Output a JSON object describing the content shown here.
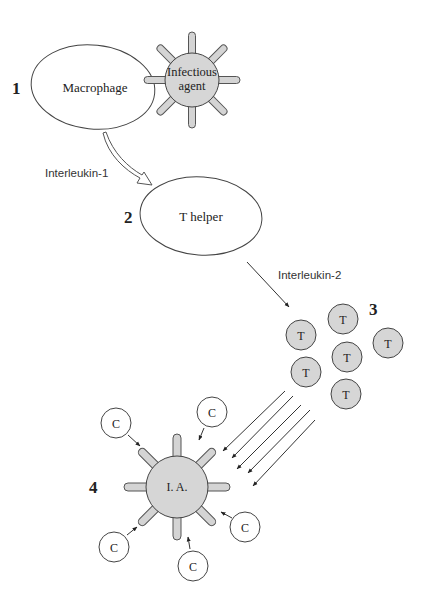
{
  "colors": {
    "cell_fill": "#d6d6d6",
    "outline": "#444444",
    "background": "#ffffff"
  },
  "steps": [
    {
      "number": "1",
      "cell_label": "Macrophage"
    },
    {
      "number": "2",
      "cell_label": "T helper"
    },
    {
      "number": "3",
      "cell_label": "T"
    },
    {
      "number": "4",
      "cell_label": "I. A."
    }
  ],
  "infectious_agent": {
    "label_line1": "Infectious",
    "label_line2": "agent"
  },
  "signals": {
    "interleukin1": "Interleukin-1",
    "interleukin2": "Interleukin-2"
  },
  "t_cells": {
    "count": 6,
    "label": "T"
  },
  "complement": {
    "count": 5,
    "label": "C"
  },
  "killer_arrow_count": 5
}
